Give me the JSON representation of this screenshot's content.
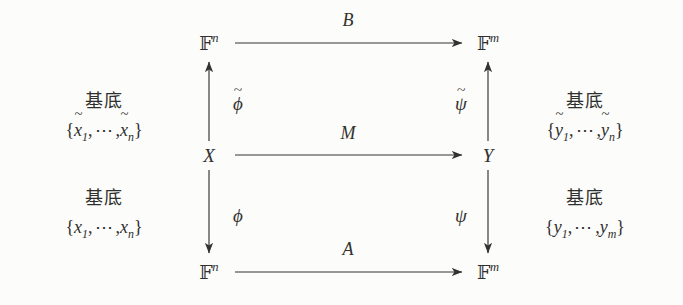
{
  "diagram": {
    "kind": "commutative-diagram",
    "background_color": "#fcfcfa",
    "ink_color": "#32322f"
  },
  "nodes": {
    "top_left": {
      "base": "F",
      "exponent": "n"
    },
    "top_right": {
      "base": "F",
      "exponent": "m"
    },
    "middle_left": {
      "label": "X"
    },
    "middle_right": {
      "label": "Y"
    },
    "bottom_left": {
      "base": "F",
      "exponent": "n"
    },
    "bottom_right": {
      "base": "F",
      "exponent": "m"
    }
  },
  "arrows": {
    "top_horizontal": {
      "label": "B",
      "direction": "right"
    },
    "middle_horizontal": {
      "label": "M",
      "direction": "right"
    },
    "bottom_horizontal": {
      "label": "A",
      "direction": "right"
    },
    "upper_left_vertical": {
      "label": "ϕ",
      "accent": "~",
      "direction": "up"
    },
    "upper_right_vertical": {
      "label": "ψ",
      "accent": "~",
      "direction": "up"
    },
    "lower_left_vertical": {
      "label": "ϕ",
      "accent": "",
      "direction": "down"
    },
    "lower_right_vertical": {
      "label": "ψ",
      "accent": "",
      "direction": "down"
    }
  },
  "annotations": {
    "left_upper": {
      "title": "基底",
      "open": "{",
      "first_var": "x",
      "first_accent": "~",
      "first_sub": "1",
      "dots": "⋯",
      "last_var": "x",
      "last_accent": "~",
      "last_sub": "n",
      "close": "}",
      "comma": ","
    },
    "left_lower": {
      "title": "基底",
      "open": "{",
      "first_var": "x",
      "first_accent": "",
      "first_sub": "1",
      "dots": "⋯",
      "last_var": "x",
      "last_accent": "",
      "last_sub": "n",
      "close": "}",
      "comma": ","
    },
    "right_upper": {
      "title": "基底",
      "open": "{",
      "first_var": "y",
      "first_accent": "~",
      "first_sub": "1",
      "dots": "⋯",
      "last_var": "y",
      "last_accent": "~",
      "last_sub": "n",
      "close": "}",
      "comma": ","
    },
    "right_lower": {
      "title": "基底",
      "open": "{",
      "first_var": "y",
      "first_accent": "",
      "first_sub": "1",
      "dots": "⋯",
      "last_var": "y",
      "last_accent": "",
      "last_sub": "m",
      "close": "}",
      "comma": ","
    }
  }
}
